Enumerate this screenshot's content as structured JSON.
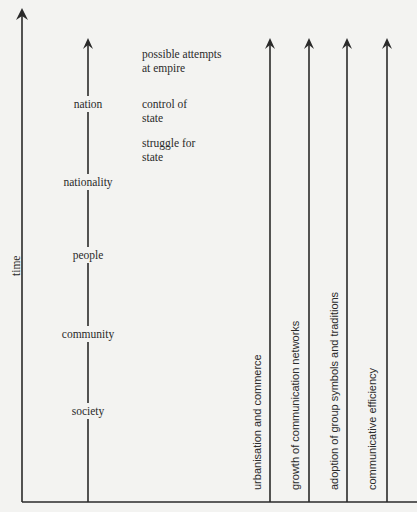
{
  "diagram": {
    "axis": {
      "label": "time"
    },
    "stages": [
      {
        "label": "nation"
      },
      {
        "label": "nationality"
      },
      {
        "label": "people"
      },
      {
        "label": "community"
      },
      {
        "label": "society"
      }
    ],
    "notes": [
      {
        "label": "possible attempts at empire"
      },
      {
        "label": "control of state"
      },
      {
        "label": "struggle for state"
      }
    ],
    "processes": [
      {
        "label": "urbanisation and commerce"
      },
      {
        "label": "growth of communication networks"
      },
      {
        "label": "adoption of group symbols and traditions"
      },
      {
        "label": "communicative efficiency"
      }
    ],
    "colors": {
      "ink": "#2a2a2a",
      "paper": "#f3f3f1"
    }
  }
}
